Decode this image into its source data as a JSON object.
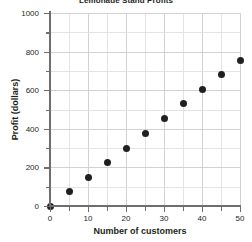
{
  "chart_data": {
    "type": "scatter",
    "title": "Lemonade Stand Profits",
    "xlabel": "Number of customers",
    "ylabel": "Profit (dollars)",
    "xlim": [
      0,
      50
    ],
    "ylim": [
      0,
      1000
    ],
    "x_ticks": [
      0,
      10,
      20,
      30,
      40,
      50
    ],
    "x_tick_labels": [
      "0",
      "10",
      "20",
      "30",
      "40",
      "50"
    ],
    "x_minor_step": 5,
    "y_ticks": [
      0,
      200,
      400,
      600,
      800,
      1000
    ],
    "y_tick_labels": [
      "0",
      "200",
      "400",
      "600",
      "800",
      "1000"
    ],
    "y_minor_step": 100,
    "grid": true,
    "legend": false,
    "marker_color": "#231f20",
    "grid_color": "#e3e3e3",
    "axis_color": "#6d6e71",
    "x": [
      0,
      5,
      10,
      15,
      20,
      25,
      30,
      35,
      40,
      45,
      50
    ],
    "y": [
      0,
      75,
      150,
      227,
      300,
      378,
      453,
      530,
      605,
      680,
      755
    ],
    "points": [
      {
        "x": 0,
        "y": 0
      },
      {
        "x": 5,
        "y": 75
      },
      {
        "x": 10,
        "y": 150
      },
      {
        "x": 15,
        "y": 227
      },
      {
        "x": 20,
        "y": 300
      },
      {
        "x": 25,
        "y": 378
      },
      {
        "x": 30,
        "y": 453
      },
      {
        "x": 35,
        "y": 530
      },
      {
        "x": 40,
        "y": 605
      },
      {
        "x": 45,
        "y": 680
      },
      {
        "x": 50,
        "y": 755
      }
    ]
  }
}
